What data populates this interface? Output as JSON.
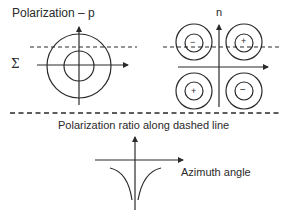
{
  "left_panel": {
    "title": "Polarization – p",
    "side_label": "Σ"
  },
  "right_panel": {
    "axis_label": "n",
    "quadrant_signs": {
      "top_left": "−",
      "top_right": "+",
      "bottom_left": "+",
      "bottom_right": "−"
    }
  },
  "bottom_panel": {
    "title": "Polarization ratio along dashed line",
    "x_axis_label": "Azimuth angle"
  },
  "colors": {
    "line": "#2a2a2a",
    "background": "#ffffff"
  }
}
